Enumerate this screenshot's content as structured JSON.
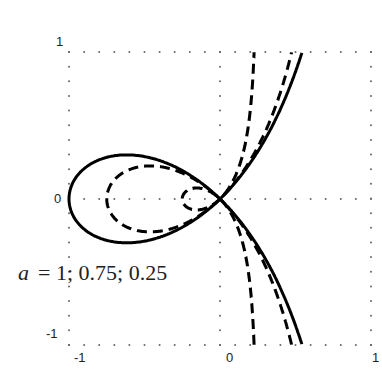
{
  "chart_data": {
    "type": "line",
    "title": "",
    "xlabel": "",
    "ylabel": "",
    "xlim": [
      -1,
      1
    ],
    "ylim": [
      -1,
      1
    ],
    "grid": "dotted at 0 and frame",
    "xticks": [
      "-1",
      "0",
      "1"
    ],
    "yticks": [
      "-1",
      "0",
      "1"
    ],
    "curve_family": "strophoid y^2 = x^2 (a + x) / (a - x)",
    "series": [
      {
        "name": "a = 1",
        "a": 1,
        "style": "solid",
        "leftmost_x": -1,
        "x_at_y_pm1": 0.55
      },
      {
        "name": "a = 0.75",
        "a": 0.75,
        "style": "dashed",
        "leftmost_x": -0.75,
        "x_at_y_pm1": 0.47
      },
      {
        "name": "a = 0.25",
        "a": 0.25,
        "style": "dashed",
        "leftmost_x": -0.25,
        "x_at_y_pm1": 0.22
      }
    ],
    "annotation": "a = 1; 0.75; 0.25"
  },
  "labels": {
    "annotation_var": "a",
    "annotation_rest": "= 1; 0.75; 0.25",
    "xtick_neg1": "-1",
    "xtick_0": "0",
    "xtick_1": "1",
    "ytick_1": "1",
    "ytick_0": "0",
    "ytick_neg1": "-1"
  }
}
